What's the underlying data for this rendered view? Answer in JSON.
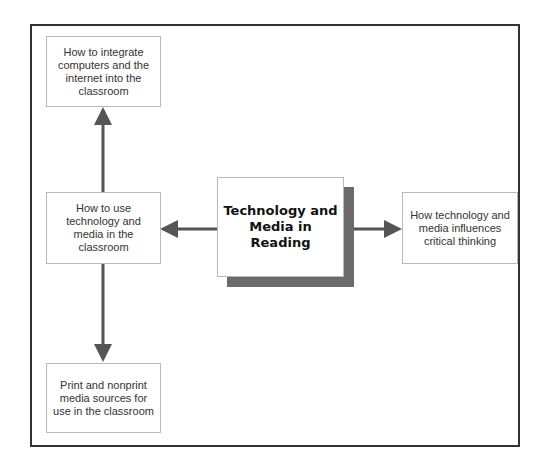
{
  "diagram": {
    "type": "concept-map",
    "center": {
      "label": "Technology and Media in Reading"
    },
    "nodes": [
      {
        "id": "top-left",
        "label": "How to integrate computers and the internet into the classroom"
      },
      {
        "id": "middle-left",
        "label": "How to use technology and media in the classroom"
      },
      {
        "id": "bottom-left",
        "label": "Print and nonprint media sources for use in the classroom"
      },
      {
        "id": "right",
        "label": "How technology and media influences critical thinking"
      }
    ],
    "edges": [
      {
        "from": "center",
        "to": "middle-left"
      },
      {
        "from": "center",
        "to": "right"
      },
      {
        "from": "middle-left",
        "to": "top-left"
      },
      {
        "from": "middle-left",
        "to": "bottom-left"
      }
    ],
    "colors": {
      "frame": "#333333",
      "arrow": "#555555",
      "shadow": "#6b6b6b",
      "box_border": "#b8b8b8"
    }
  }
}
